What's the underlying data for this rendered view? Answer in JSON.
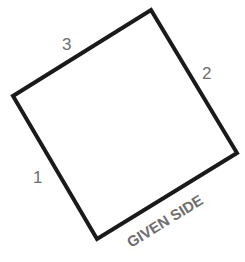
{
  "diagram": {
    "shape": "square",
    "vertices": [
      [
        151,
        10
      ],
      [
        237,
        153
      ],
      [
        97,
        239
      ],
      [
        13,
        96
      ]
    ],
    "stroke_color": "#1a1a1a",
    "label_color": "#6e6e6e",
    "labels": {
      "side1": "1",
      "side2": "2",
      "side3": "3",
      "given_side": "GIVEN SIDE"
    }
  }
}
